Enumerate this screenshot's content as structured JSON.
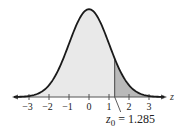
{
  "chart_data": {
    "type": "area",
    "title": "",
    "xlabel": "z",
    "ylabel": "",
    "xlim": [
      -3.75,
      3.75
    ],
    "x_ticks": [
      -3,
      -2,
      -1,
      0,
      1,
      2,
      3
    ],
    "x_tick_labels": [
      "−3",
      "−2",
      "−1",
      "0",
      "1",
      "2",
      "3"
    ],
    "grid": false,
    "legend": null,
    "series": [
      {
        "name": "standard normal pdf",
        "mean": 0,
        "sd": 1
      }
    ],
    "shaded_region": {
      "from": 1.285,
      "to": "infinity",
      "label": "right tail"
    },
    "annotation": {
      "variable": "z",
      "subscript": "0",
      "text": " = 1.285",
      "value": 1.285
    }
  },
  "colors": {
    "curve": "#1a1a1a",
    "fill_light": "#e9e9e9",
    "fill_dark": "#b9b9b9",
    "axis": "#555555"
  }
}
